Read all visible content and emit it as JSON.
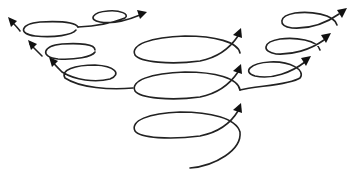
{
  "diagram": {
    "title": "",
    "colors": {
      "stroke": "#222222",
      "arrowhead": "#111111",
      "background": "#ffffff"
    },
    "arrows": [
      {
        "id": "top-right-small",
        "direction": "right",
        "group": "top-left"
      },
      {
        "id": "left-1",
        "direction": "up-left",
        "group": "left"
      },
      {
        "id": "left-2",
        "direction": "up-left",
        "group": "left"
      },
      {
        "id": "left-3",
        "direction": "up-left",
        "group": "left"
      },
      {
        "id": "center-1",
        "direction": "up-right",
        "group": "center"
      },
      {
        "id": "center-2",
        "direction": "up-right",
        "group": "center"
      },
      {
        "id": "center-3",
        "direction": "up-right",
        "group": "center"
      },
      {
        "id": "right-1",
        "direction": "up-right",
        "group": "right"
      },
      {
        "id": "right-2",
        "direction": "up-right",
        "group": "right"
      },
      {
        "id": "right-3",
        "direction": "up-right",
        "group": "right"
      }
    ]
  }
}
